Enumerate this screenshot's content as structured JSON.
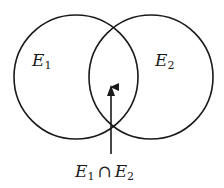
{
  "diagram": {
    "type": "venn",
    "stroke_color": "#1a1a1a",
    "background": "#ffffff",
    "sets": [
      {
        "id": "E1",
        "symbol": "E",
        "subscript": "1",
        "cx": 76,
        "cy": 77,
        "r": 62
      },
      {
        "id": "E2",
        "symbol": "E",
        "subscript": "2",
        "cx": 151,
        "cy": 77,
        "r": 62
      }
    ],
    "intersection": {
      "symbol_a": "E",
      "subscript_a": "1",
      "operator": "∩",
      "symbol_b": "E",
      "subscript_b": "2"
    },
    "arrow": {
      "x": 111,
      "y_tail": 154,
      "y_head": 86
    }
  }
}
